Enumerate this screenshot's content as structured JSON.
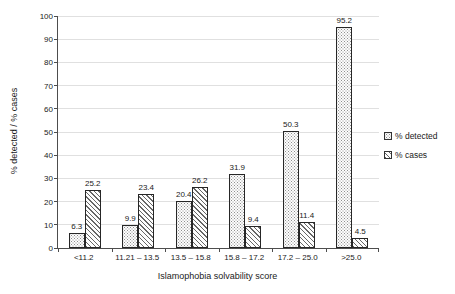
{
  "chart_data": {
    "type": "bar",
    "categories": [
      "<11.2",
      "11.21 – 13.5",
      "13.5 – 15.8",
      "15.8 – 17.2",
      "17.2 – 25.0",
      ">25.0"
    ],
    "series": [
      {
        "name": "% detected",
        "values": [
          6.3,
          9.9,
          20.4,
          31.9,
          50.3,
          95.2
        ],
        "fill": "stipple"
      },
      {
        "name": "% cases",
        "values": [
          25.2,
          23.4,
          26.2,
          9.4,
          11.4,
          4.5
        ],
        "fill": "hatch"
      }
    ],
    "title": "",
    "xlabel": "Islamophobia solvability score",
    "ylabel": "% detected / % cases",
    "ylim": [
      0,
      100
    ],
    "ytick_step": 10,
    "grid": "horizontal",
    "legend_position": "right",
    "data_labels": true,
    "colors": {
      "background": "#ffffff",
      "gridline": "#e0e0e0",
      "axis": "#4d4d4d",
      "bar_outline": "#262626",
      "stipple_dot": "#8f8f8f",
      "hatch_line": "#666666",
      "text": "#1a1a1a"
    }
  }
}
